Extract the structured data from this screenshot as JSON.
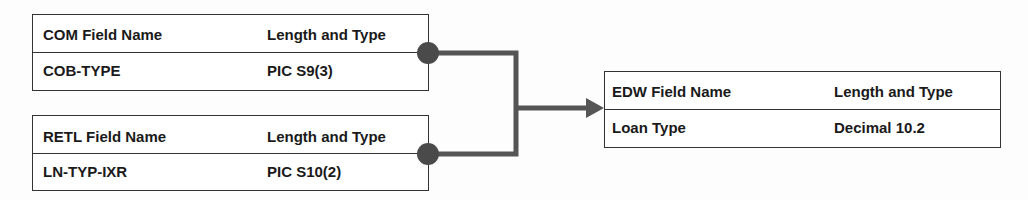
{
  "tables": {
    "com": {
      "header": {
        "name": "COM Field Name",
        "type": "Length and Type"
      },
      "row": {
        "name": "COB-TYPE",
        "type": "PIC S9(3)"
      }
    },
    "retl": {
      "header": {
        "name": "RETL Field Name",
        "type": "Length and Type"
      },
      "row": {
        "name": "LN-TYP-IXR",
        "type": "PIC S10(2)"
      }
    },
    "edw": {
      "header": {
        "name": "EDW Field Name",
        "type": "Length and Type"
      },
      "row": {
        "name": "Loan Type",
        "type": "Decimal 10.2"
      }
    }
  },
  "colors": {
    "line": "#555555",
    "dot": "#4a4a4a",
    "border": "#333333"
  }
}
